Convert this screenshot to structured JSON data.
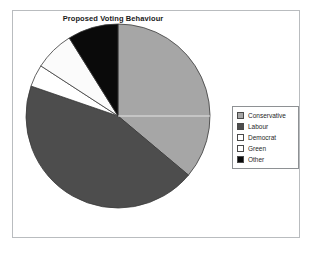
{
  "chart_data": {
    "type": "pie",
    "title": "Proposed Voting Behaviour",
    "xlabel": "",
    "ylabel": "",
    "legend_position": "right",
    "grid": false,
    "categories": [
      "Conservative",
      "Labour",
      "Democrat",
      "Green",
      "Other"
    ],
    "values": [
      36,
      44,
      4,
      7,
      9
    ],
    "units": "percent",
    "start_angle_deg": 0,
    "direction": "clockwise",
    "slices": [
      {
        "label": "Conservative",
        "value": 36,
        "color": "#a6a6a6",
        "start_deg": 0,
        "end_deg": 130
      },
      {
        "label": "Labour",
        "value": 44,
        "color": "#4d4d4d",
        "start_deg": 130,
        "end_deg": 289
      },
      {
        "label": "Democrat",
        "value": 4,
        "color": "#ffffff",
        "start_deg": 289,
        "end_deg": 303
      },
      {
        "label": "Green",
        "value": 7,
        "color": "#fbfbfb",
        "start_deg": 303,
        "end_deg": 328
      },
      {
        "label": "Other",
        "value": 9,
        "color": "#0a0a0a",
        "start_deg": 328,
        "end_deg": 360
      }
    ]
  },
  "chart": {
    "title": "Proposed Voting Behaviour"
  },
  "legend": {
    "items": [
      {
        "label": "Conservative",
        "swatch": "#a6a6a6",
        "icon": "legend-swatch-icon"
      },
      {
        "label": "Labour",
        "swatch": "#4d4d4d",
        "icon": "legend-swatch-icon"
      },
      {
        "label": "Democrat",
        "swatch": "#ffffff",
        "icon": "legend-swatch-icon"
      },
      {
        "label": "Green",
        "swatch": "#ffffff",
        "icon": "legend-swatch-icon"
      },
      {
        "label": "Other",
        "swatch": "#0a0a0a",
        "icon": "legend-swatch-icon"
      }
    ]
  },
  "colors": {
    "frame_border": "#b9bcbf",
    "legend_border": "#8e9194",
    "slice_outline": "#3a3a3a",
    "background": "#ffffff",
    "text": "#1a1a1a"
  }
}
